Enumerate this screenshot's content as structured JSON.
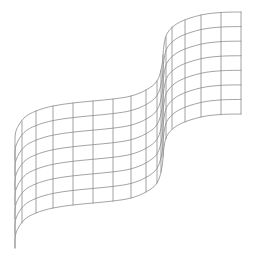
{
  "figure": {
    "width": 255,
    "height": 263,
    "background": "#ffffff",
    "line_color": "#8c8c8c",
    "line_width": 0.8,
    "grid": {
      "rows": 7,
      "columns": 16,
      "ruling_offset": [
        0,
        102
      ],
      "top_profile": [
        [
          15,
          146
        ],
        [
          16,
          131
        ],
        [
          24,
          118
        ],
        [
          36,
          111
        ],
        [
          53,
          106
        ],
        [
          73,
          103
        ],
        [
          93,
          101
        ],
        [
          113,
          99
        ],
        [
          131,
          96
        ],
        [
          146,
          90
        ],
        [
          157,
          81
        ],
        [
          162,
          65
        ],
        [
          164,
          45
        ],
        [
          168,
          32
        ],
        [
          180,
          22
        ],
        [
          201,
          15
        ],
        [
          221,
          12.5
        ],
        [
          241,
          12
        ]
      ],
      "ruling_points": [
        [
          15,
          146
        ],
        [
          22,
          121
        ],
        [
          36,
          111
        ],
        [
          53,
          106
        ],
        [
          73,
          103
        ],
        [
          93,
          101
        ],
        [
          113,
          99
        ],
        [
          131,
          96
        ],
        [
          146,
          90
        ],
        [
          157,
          81
        ],
        [
          161,
          70
        ],
        [
          163,
          55
        ],
        [
          166,
          37
        ],
        [
          172,
          27
        ],
        [
          185,
          20
        ],
        [
          201,
          15
        ],
        [
          221,
          12.5
        ],
        [
          241,
          12
        ]
      ]
    }
  }
}
